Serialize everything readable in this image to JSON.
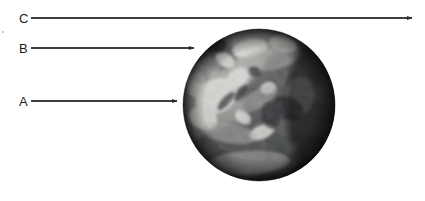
{
  "figure": {
    "background_color": "#ffffff",
    "width": 425,
    "height": 201,
    "line_color": "#3d3d3d",
    "text_color": "#1c1c1c"
  },
  "labels": [
    {
      "id": "C",
      "text": "C",
      "text_x": 19,
      "text_y": 23,
      "line_start_x": 31,
      "line_start_y": 18,
      "line_end_x": 412,
      "line_end_y": 18,
      "arrow_tip_x": 418,
      "arrow_tip_y": 18,
      "target": "space-beyond-atmosphere"
    },
    {
      "id": "B",
      "text": "B",
      "text_x": 19,
      "text_y": 53,
      "line_start_x": 31,
      "line_start_y": 48,
      "line_end_x": 194,
      "line_end_y": 48,
      "arrow_tip_x": 200,
      "arrow_tip_y": 48,
      "target": "upper-atmosphere-edge"
    },
    {
      "id": "A",
      "text": "A",
      "text_x": 19,
      "text_y": 106,
      "line_start_x": 31,
      "line_start_y": 101,
      "line_end_x": 177,
      "line_end_y": 101,
      "arrow_tip_x": 183,
      "arrow_tip_y": 101,
      "target": "earth-surface"
    }
  ],
  "globe": {
    "name": "earth-globe",
    "center_x": 259,
    "center_y": 105,
    "radius": 76,
    "left": 183,
    "top": 24,
    "right": 335,
    "bottom": 186,
    "light_tone": "#d8d8d6",
    "mid_tone": "#8d8d8b",
    "dark_tone": "#3a3a3a",
    "shadow_tone": "#121212"
  },
  "artifacts": [
    {
      "name": "speck-left-margin",
      "x": 2,
      "y": 31,
      "w": 2,
      "h": 2
    }
  ]
}
